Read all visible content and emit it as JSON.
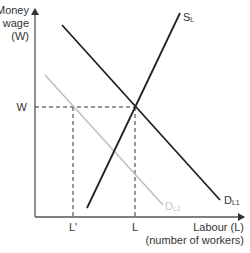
{
  "diagram": {
    "type": "labour-market-supply-demand",
    "y_axis": {
      "label_line1": "Money",
      "label_line2": "wage",
      "label_line3": "(W)"
    },
    "x_axis": {
      "label_line1": "Labour (L)",
      "label_line2": "(number of workers)"
    },
    "tick_labels": {
      "wage": "W",
      "labour": "L",
      "labour_prime": "L'"
    },
    "curves": {
      "supply": {
        "main": "S",
        "sub": "L",
        "color": "#222222"
      },
      "demand1": {
        "main": "D",
        "sub": "L1",
        "color": "#222222"
      },
      "demand2": {
        "main": "D",
        "sub": "L2",
        "color": "#c0c0c0"
      }
    }
  }
}
